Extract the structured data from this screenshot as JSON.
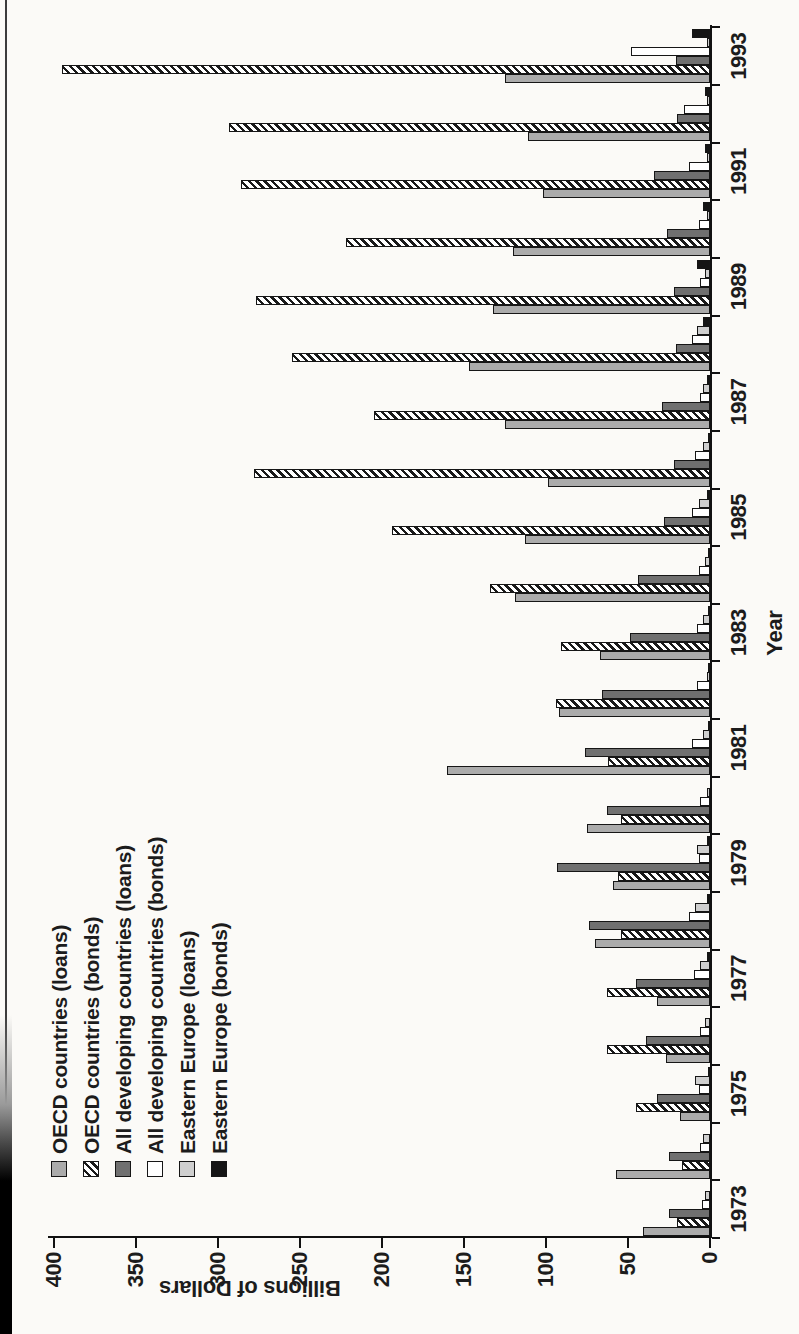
{
  "page": {
    "description": "Scanned book figure: grouped bar chart of international capital-market financing, printed sideways (rotated 90° counter-clockwise) on a portrait page"
  },
  "chart_data": {
    "type": "bar",
    "title": "",
    "xlabel": "Year",
    "ylabel": "Billions of Dollars",
    "ylim": [
      0,
      400
    ],
    "yticks": [
      0,
      50,
      100,
      150,
      200,
      250,
      300,
      350,
      400
    ],
    "grid": false,
    "legend_position": "upper-left, vertical list, no frame",
    "orientation_note": "entire landscape chart rotated -90deg on page; bars grow leftward, years run bottom-to-top on the right",
    "categories": [
      1973,
      1974,
      1975,
      1976,
      1977,
      1978,
      1979,
      1980,
      1981,
      1982,
      1983,
      1984,
      1985,
      1986,
      1987,
      1988,
      1989,
      1990,
      1991,
      1992,
      1993
    ],
    "xtick_labels_shown": [
      "1973",
      "1975",
      "1977",
      "1979",
      "1981",
      "1983",
      "1985",
      "1987",
      "1989",
      "1991",
      "1993"
    ],
    "series": [
      {
        "name": "OECD countries (loans)",
        "style": "solid medium gray",
        "color": "#ababab",
        "values": [
          41,
          57,
          18,
          27,
          32,
          70,
          59,
          75,
          160,
          92,
          67,
          119,
          113,
          99,
          125,
          147,
          132,
          120,
          102,
          111,
          125
        ]
      },
      {
        "name": "OECD countries (bonds)",
        "style": "diagonal black hatch on white",
        "color": "#ffffff",
        "values": [
          20,
          17,
          45,
          63,
          63,
          54,
          56,
          54,
          62,
          94,
          91,
          134,
          194,
          278,
          205,
          255,
          277,
          222,
          286,
          293,
          395
        ]
      },
      {
        "name": "All developing countries (loans)",
        "style": "solid dark gray",
        "color": "#707070",
        "values": [
          25,
          25,
          32,
          39,
          45,
          74,
          93,
          63,
          76,
          66,
          49,
          44,
          28,
          22,
          29,
          21,
          22,
          26,
          34,
          20,
          21
        ]
      },
      {
        "name": "All developing countries (bonds)",
        "style": "white with black outline",
        "color": "#ffffff",
        "values": [
          5,
          6,
          7,
          6,
          10,
          13,
          7,
          6,
          11,
          8,
          8,
          7,
          11,
          9,
          6,
          11,
          6,
          7,
          13,
          16,
          48
        ]
      },
      {
        "name": "Eastern Europe (loans)",
        "style": "solid light gray",
        "color": "#cfcfcf",
        "values": [
          3,
          4,
          9,
          3,
          6,
          9,
          8,
          2,
          4,
          2,
          4,
          3,
          7,
          4,
          4,
          8,
          3,
          2,
          2,
          2,
          2
        ]
      },
      {
        "name": "Eastern Europe (bonds)",
        "style": "solid black",
        "color": "#151515",
        "values": [
          0,
          0,
          1,
          0,
          2,
          2,
          2,
          0,
          1,
          1,
          1,
          1,
          2,
          1,
          2,
          4,
          8,
          4,
          3,
          3,
          11
        ]
      }
    ]
  }
}
